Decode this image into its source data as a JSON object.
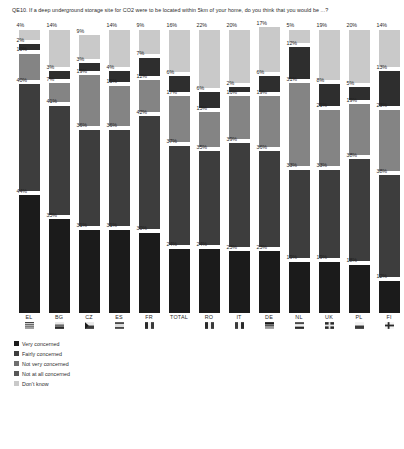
{
  "chart_data": {
    "type": "bar",
    "subtype": "stacked-bar-100",
    "title": "QE10. If a deep underground storage site for CO2 were to be located within 5km of your home, do you think that you would be ...?",
    "xlabel": "",
    "ylabel": "",
    "ylim": [
      0,
      100
    ],
    "grid": false,
    "legend_position": "bottom-left",
    "stack_order_bottom_to_top": [
      "Very concerned",
      "Fairly concerned",
      "Not very concerned",
      "Not at all concerned",
      "Don't know"
    ],
    "categories": [
      "EL",
      "BG",
      "CZ",
      "ES",
      "FR",
      "TOTAL",
      "RO",
      "IT",
      "DE",
      "NL",
      "UK",
      "PL",
      "FI"
    ],
    "series": [
      {
        "name": "Very concerned",
        "color": "#1b1b1b",
        "values": [
          44,
          35,
          31,
          31,
          30,
          24,
          24,
          23,
          23,
          19,
          19,
          18,
          12
        ]
      },
      {
        "name": "Fairly concerned",
        "color": "#3d3d3d",
        "values": [
          40,
          41,
          36,
          36,
          42,
          37,
          35,
          39,
          36,
          33,
          33,
          38,
          38
        ]
      },
      {
        "name": "Not very concerned",
        "color": "#848484",
        "values": [
          10,
          7,
          19,
          15,
          12,
          17,
          13,
          16,
          19,
          31,
          21,
          19,
          23
        ]
      },
      {
        "name": "Not at all concerned",
        "color": "#2e2e2e",
        "values": [
          2,
          3,
          3,
          4,
          7,
          6,
          6,
          2,
          6,
          12,
          8,
          5,
          13
        ]
      },
      {
        "name": "Don't know",
        "color": "#c9c9c9",
        "values": [
          4,
          14,
          9,
          14,
          9,
          16,
          22,
          20,
          17,
          5,
          19,
          20,
          14
        ]
      }
    ],
    "labels": {
      "EL": {
        "dont_know": "4%",
        "not_at_all": "2%",
        "not_very": "10%",
        "fairly": "40%",
        "very": "44%"
      },
      "BG": {
        "dont_know": "14%",
        "not_at_all": "3%",
        "not_very": "7%",
        "fairly": "41%",
        "very": "35%"
      },
      "CZ": {
        "dont_know": "9%",
        "not_at_all": "3%",
        "not_very": "19%",
        "fairly": "36%",
        "very": "31%"
      },
      "ES": {
        "dont_know": "14%",
        "not_at_all": "4%",
        "not_very": "15%",
        "fairly": "36%",
        "very": "31%"
      },
      "FR": {
        "dont_know": "9%",
        "not_at_all": "7%",
        "not_very": "12%",
        "fairly": "42%",
        "very": "30%"
      },
      "TOTAL": {
        "dont_know": "16%",
        "not_at_all": "6%",
        "not_very": "17%",
        "fairly": "37%",
        "very": "24%"
      },
      "RO": {
        "dont_know": "22%",
        "not_at_all": "6%",
        "not_very": "13%",
        "fairly": "35%",
        "very": "24%"
      },
      "IT": {
        "dont_know": "20%",
        "not_at_all": "2%",
        "not_very": "16%",
        "fairly": "39%",
        "very": "23%"
      },
      "DE": {
        "dont_know": "17%",
        "not_at_all": "6%",
        "not_very": "19%",
        "fairly": "36%",
        "very": "23%"
      },
      "NL": {
        "dont_know": "5%",
        "not_at_all": "12%",
        "not_very": "31%",
        "fairly": "33%",
        "very": "19%"
      },
      "UK": {
        "dont_know": "19%",
        "not_at_all": "8%",
        "not_very": "21%",
        "fairly": "33%",
        "very": "19%"
      },
      "PL": {
        "dont_know": "20%",
        "not_at_all": "5%",
        "not_very": "19%",
        "fairly": "38%",
        "very": "18%"
      },
      "FI": {
        "dont_know": "14%",
        "not_at_all": "13%",
        "not_very": "23%",
        "fairly": "38%",
        "very": "12%"
      }
    }
  },
  "axis": {
    "items": [
      {
        "code": "EL",
        "flag": "flag-icon-el"
      },
      {
        "code": "BG",
        "flag": "flag-icon-bg"
      },
      {
        "code": "CZ",
        "flag": "flag-icon-cz"
      },
      {
        "code": "ES",
        "flag": "flag-icon-es"
      },
      {
        "code": "FR",
        "flag": "flag-icon-fr"
      },
      {
        "code": "TOTAL",
        "flag": ""
      },
      {
        "code": "RO",
        "flag": "flag-icon-ro"
      },
      {
        "code": "IT",
        "flag": "flag-icon-it"
      },
      {
        "code": "DE",
        "flag": "flag-icon-de"
      },
      {
        "code": "NL",
        "flag": "flag-icon-nl"
      },
      {
        "code": "UK",
        "flag": "flag-icon-uk"
      },
      {
        "code": "PL",
        "flag": "flag-icon-pl"
      },
      {
        "code": "FI",
        "flag": "flag-icon-fi"
      }
    ]
  },
  "legend": {
    "items": [
      {
        "label": "Very concerned",
        "color": "#1b1b1b"
      },
      {
        "label": "Fairly concerned",
        "color": "#3d3d3d"
      },
      {
        "label": "Not very concerned",
        "color": "#6f6f6f"
      },
      {
        "label": "Not at all concerned",
        "color": "#575757"
      },
      {
        "label": "Don't know",
        "color": "#c9c9c9"
      }
    ]
  }
}
